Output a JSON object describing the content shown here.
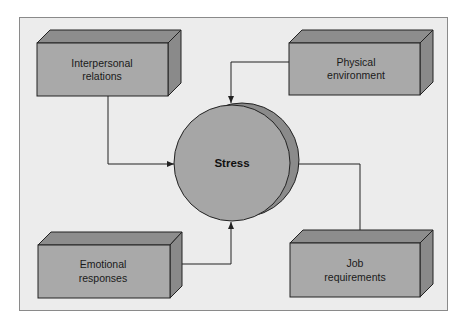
{
  "diagram": {
    "center": {
      "label": "Stress"
    },
    "factors": [
      {
        "id": "interpersonal",
        "line1": "Interpersonal",
        "line2": "relations"
      },
      {
        "id": "physical",
        "line1": "Physical",
        "line2": "environment"
      },
      {
        "id": "emotional",
        "line1": "Emotional",
        "line2": "responses"
      },
      {
        "id": "job",
        "line1": "Job",
        "line2": "requirements"
      }
    ],
    "edges": [
      {
        "from": "Interpersonal relations",
        "to": "Stress"
      },
      {
        "from": "Physical environment",
        "to": "Stress"
      },
      {
        "from": "Emotional responses",
        "to": "Stress"
      },
      {
        "from": "Job requirements",
        "to": "Stress"
      }
    ]
  },
  "colors": {
    "page": "#ffffff",
    "frame_fill": "#ececec",
    "frame_border": "#8a8a8a",
    "box_front": "#a9a9a9",
    "box_top": "#8d8d8d",
    "box_side": "#8a8a8a",
    "circle_front": "#a6a6a6",
    "circle_shadow": "#8b8b8b",
    "line": "#222222"
  }
}
